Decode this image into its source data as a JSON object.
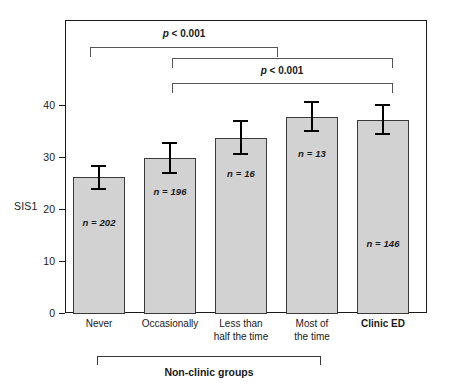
{
  "chart_data": {
    "type": "bar",
    "title": "",
    "xlabel": "",
    "ylabel": "SIS1",
    "ylim": [
      0,
      45
    ],
    "yticks": [
      0,
      10,
      20,
      30,
      40
    ],
    "ytick_labels": [
      "0",
      "10",
      "20",
      "30",
      "40"
    ],
    "grid": false,
    "legend": "none",
    "categories": [
      "Never",
      "Occasionally",
      "Less than\nhalf the time",
      "Most of\nthe time",
      "Clinic ED"
    ],
    "values": [
      26.2,
      29.9,
      33.7,
      37.8,
      37.3
    ],
    "error_low": [
      25.0,
      28.4,
      32.1,
      35.8,
      35.3
    ],
    "error_high": [
      27.6,
      31.4,
      35.4,
      39.5,
      39.2
    ],
    "point_labels": [
      "n = 202",
      "n = 196",
      "n = 16",
      "n = 13",
      "n = 146"
    ],
    "n_values": [
      202,
      196,
      16,
      13,
      146
    ],
    "annotations": [
      {
        "text": "p < 0.001",
        "from": "Never",
        "to": "Most of\nthe time"
      },
      {
        "text": "p < 0.001",
        "from": "Occasionally",
        "to": "Clinic ED"
      }
    ],
    "group_bracket_label": "Non-clinic groups",
    "group_bracket_members": [
      "Never",
      "Occasionally",
      "Less than\nhalf the time",
      "Most of\nthe time"
    ],
    "colors": {
      "bar_fill": "#d2d2d2",
      "bar_border": "#3a3a3a",
      "error_bar": "#000000",
      "axis": "#1a1a1a",
      "bracket": "#555555",
      "text": "#1a1a1a",
      "background": "#ffffff"
    }
  },
  "axis": {
    "y_title": "SIS1",
    "ticks": [
      {
        "label": "40"
      },
      {
        "label": "30"
      },
      {
        "label": "20"
      },
      {
        "label": "10"
      },
      {
        "label": "0"
      }
    ]
  },
  "bars": [
    {
      "label": "Never",
      "n_label": "n = 202"
    },
    {
      "label": "Occasionally",
      "n_label": "n = 196"
    },
    {
      "label": "Less than\nhalf the time",
      "n_label": "n = 16"
    },
    {
      "label": "Most of\nthe time",
      "n_label": "n = 13"
    },
    {
      "label": "Clinic ED",
      "n_label": "n = 146"
    }
  ],
  "significance": [
    {
      "text": "p < 0.001"
    },
    {
      "text": "p < 0.001"
    }
  ],
  "group": {
    "label": "Non-clinic groups"
  }
}
